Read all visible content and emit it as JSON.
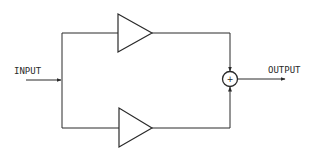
{
  "diagram": {
    "type": "block-diagram",
    "labels": {
      "input": "INPUT",
      "output": "OUTPUT",
      "sum_symbol": "+"
    },
    "nodes": [
      {
        "id": "input",
        "kind": "terminal",
        "label": "INPUT"
      },
      {
        "id": "amp_top",
        "kind": "amplifier"
      },
      {
        "id": "amp_bottom",
        "kind": "amplifier"
      },
      {
        "id": "summer",
        "kind": "summing-junction",
        "symbol": "+"
      },
      {
        "id": "output",
        "kind": "terminal",
        "label": "OUTPUT"
      }
    ],
    "edges": [
      {
        "from": "input",
        "to": "amp_top"
      },
      {
        "from": "input",
        "to": "amp_bottom"
      },
      {
        "from": "amp_top",
        "to": "summer"
      },
      {
        "from": "amp_bottom",
        "to": "summer"
      },
      {
        "from": "summer",
        "to": "output"
      }
    ],
    "colors": {
      "stroke": "#2a2a2a",
      "background": "#ffffff"
    }
  }
}
